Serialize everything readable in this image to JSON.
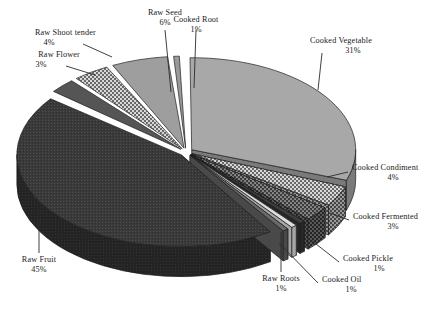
{
  "chart_data": {
    "type": "pie",
    "title": "",
    "subtitle": "",
    "xlabel": "",
    "ylabel": "",
    "legend_position": "none",
    "grid": false,
    "style": "3d-exploded-pie-grayscale",
    "value_unit": "percent",
    "total": 100,
    "categories": [
      "Cooked Root",
      "Cooked Vegetable",
      "Cooked Condiment",
      "Cooked Fermented",
      "Cooked Pickle",
      "Cooked Oil",
      "Raw Roots",
      "Raw Fruit",
      "Raw Flower",
      "Raw Shoot tender",
      "Raw Seed"
    ],
    "values": [
      1,
      31,
      4,
      3,
      1,
      1,
      1,
      45,
      3,
      4,
      6
    ],
    "labels": [
      "Cooked Root 1%",
      "Cooked Vegetable 31%",
      "Cooked Condiment 4%",
      "Cooked Fermented 3%",
      "Cooked Pickle 1%",
      "Cooked Oil 1%",
      "Raw Roots 1%",
      "Raw Fruit 45%",
      "Raw Flower 3%",
      "Raw Shoot tender 4%",
      "Raw Seed 6%"
    ],
    "slices": [
      {
        "name": "Cooked Root",
        "percent_text": "1%",
        "value": 1,
        "fill": "#9a9a9a",
        "side": "#6d6d6d",
        "pattern": "solid"
      },
      {
        "name": "Cooked Vegetable",
        "percent_text": "31%",
        "value": 31,
        "fill": "#a8a8a8",
        "side": "#7a7a7a",
        "pattern": "solid"
      },
      {
        "name": "Cooked Condiment",
        "percent_text": "4%",
        "value": 4,
        "fill": "#cfcfcf",
        "side": "#8a8a8a",
        "pattern": "checker"
      },
      {
        "name": "Cooked Fermented",
        "percent_text": "3%",
        "value": 3,
        "fill": "#4a4a4a",
        "side": "#303030",
        "pattern": "dots"
      },
      {
        "name": "Cooked Pickle",
        "percent_text": "1%",
        "value": 1,
        "fill": "#3d3d3d",
        "side": "#272727",
        "pattern": "solid"
      },
      {
        "name": "Cooked Oil",
        "percent_text": "1%",
        "value": 1,
        "fill": "#dcdcdc",
        "side": "#a5a5a5",
        "pattern": "solid"
      },
      {
        "name": "Raw Roots",
        "percent_text": "1%",
        "value": 1,
        "fill": "#6a6a6a",
        "side": "#494949",
        "pattern": "solid"
      },
      {
        "name": "Raw Fruit",
        "percent_text": "45%",
        "value": 45,
        "fill": "#3a3a3a",
        "side": "#232323",
        "pattern": "noise"
      },
      {
        "name": "Raw Flower",
        "percent_text": "3%",
        "value": 3,
        "fill": "#555555",
        "side": "#343434",
        "pattern": "solid"
      },
      {
        "name": "Raw Shoot tender",
        "percent_text": "4%",
        "value": 4,
        "fill": "#c6c6c6",
        "side": "#868686",
        "pattern": "checker"
      },
      {
        "name": "Raw Seed",
        "percent_text": "6%",
        "value": 6,
        "fill": "#9e9e9e",
        "side": "#707070",
        "pattern": "solid"
      }
    ]
  },
  "callouts": {
    "raw_shoot_tender": {
      "name": "Raw Shoot tender",
      "pct": "4%"
    },
    "raw_flower": {
      "name": "Raw Flower",
      "pct": "3%"
    },
    "raw_seed": {
      "name": "Raw Seed",
      "pct": "6%"
    },
    "cooked_root": {
      "name": "Cooked Root",
      "pct": "1%"
    },
    "cooked_vegetable": {
      "name": "Cooked Vegetable",
      "pct": "31%"
    },
    "cooked_condiment": {
      "name": "Cooked Condiment",
      "pct": "4%"
    },
    "cooked_fermented": {
      "name": "Cooked Fermented",
      "pct": "3%"
    },
    "cooked_pickle": {
      "name": "Cooked Pickle",
      "pct": "1%"
    },
    "cooked_oil": {
      "name": "Cooked Oil",
      "pct": "1%"
    },
    "raw_roots": {
      "name": "Raw Roots",
      "pct": "1%"
    },
    "raw_fruit": {
      "name": "Raw Fruit",
      "pct": "45%"
    }
  }
}
